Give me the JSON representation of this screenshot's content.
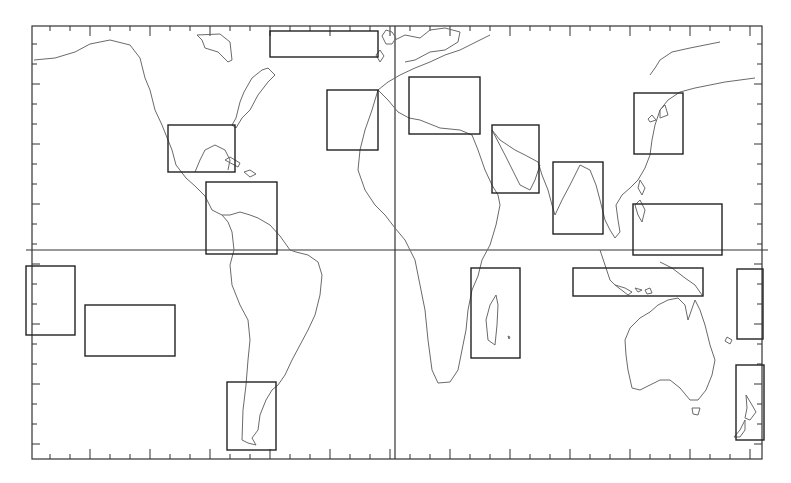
{
  "map": {
    "type": "world-map-outline",
    "projection": "equirectangular",
    "frame": {
      "x": 32,
      "y": 26,
      "width": 730,
      "height": 433
    },
    "equator_y": 250,
    "prime_meridian_x": 395,
    "colors": {
      "background": "#ffffff",
      "coastline": "#6a6a6a",
      "frame": "#333333",
      "region_box": "#222222"
    },
    "tick_spacing_px": 20,
    "major_tick_every": 3,
    "regions": [
      {
        "id": "north-atlantic",
        "x": 270,
        "y": 31,
        "w": 108,
        "h": 26
      },
      {
        "id": "gulf-of-mexico",
        "x": 168,
        "y": 125,
        "w": 67,
        "h": 47
      },
      {
        "id": "northern-south-america",
        "x": 206,
        "y": 182,
        "w": 71,
        "h": 72
      },
      {
        "id": "northwest-africa",
        "x": 327,
        "y": 90,
        "w": 51,
        "h": 60
      },
      {
        "id": "mediterranean",
        "x": 409,
        "y": 77,
        "w": 71,
        "h": 57
      },
      {
        "id": "arabian-peninsula",
        "x": 492,
        "y": 125,
        "w": 47,
        "h": 68
      },
      {
        "id": "india",
        "x": 553,
        "y": 162,
        "w": 50,
        "h": 72
      },
      {
        "id": "east-asia",
        "x": 634,
        "y": 93,
        "w": 49,
        "h": 61
      },
      {
        "id": "maritime-southeast-asia",
        "x": 633,
        "y": 204,
        "w": 89,
        "h": 51
      },
      {
        "id": "eastern-pacific-west",
        "x": 26,
        "y": 266,
        "w": 49,
        "h": 69
      },
      {
        "id": "south-pacific",
        "x": 85,
        "y": 305,
        "w": 90,
        "h": 51
      },
      {
        "id": "patagonia",
        "x": 227,
        "y": 382,
        "w": 49,
        "h": 68
      },
      {
        "id": "madagascar",
        "x": 471,
        "y": 268,
        "w": 49,
        "h": 90
      },
      {
        "id": "indonesia",
        "x": 573,
        "y": 268,
        "w": 130,
        "h": 28
      },
      {
        "id": "southwest-pacific",
        "x": 737,
        "y": 269,
        "w": 26,
        "h": 70
      },
      {
        "id": "new-zealand",
        "x": 736,
        "y": 365,
        "w": 28,
        "h": 75
      }
    ]
  }
}
